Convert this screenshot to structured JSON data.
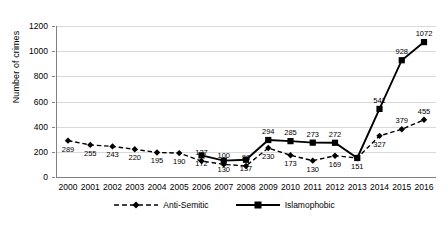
{
  "chart_data": {
    "type": "line",
    "title": "",
    "xlabel": "",
    "ylabel": "Number of crimes",
    "ylim": [
      0,
      1200
    ],
    "yticks": [
      0,
      200,
      400,
      600,
      800,
      1000,
      1200
    ],
    "grid": true,
    "legend_position": "bottom-center",
    "categories": [
      "2000",
      "2001",
      "2002",
      "2003",
      "2004",
      "2005",
      "2006",
      "2007",
      "2008",
      "2009",
      "2010",
      "2011",
      "2012",
      "2013",
      "2014",
      "2015",
      "2016"
    ],
    "series": [
      {
        "name": "Anti-Semitic",
        "style": "dashed",
        "marker": "diamond",
        "color": "#000000",
        "values": [
          289,
          255,
          243,
          220,
          195,
          190,
          127,
          100,
          88,
          230,
          173,
          130,
          169,
          151,
          327,
          379,
          455
        ],
        "labels": [
          "289",
          "255",
          "243",
          "220",
          "195",
          "190",
          "127",
          "100",
          "88",
          "230",
          "173",
          "130",
          "169",
          "151",
          "327",
          "379",
          "455"
        ]
      },
      {
        "name": "Islamophobic",
        "style": "solid",
        "marker": "square",
        "color": "#000000",
        "values": [
          null,
          null,
          null,
          null,
          null,
          null,
          172,
          130,
          137,
          294,
          285,
          273,
          272,
          151,
          541,
          928,
          1072
        ],
        "labels": [
          "",
          "",
          "",
          "",
          "",
          "",
          "172",
          "130",
          "137",
          "294",
          "285",
          "273",
          "272",
          "",
          "541",
          "928",
          "1072"
        ]
      }
    ]
  },
  "legend": {
    "items": [
      {
        "label": "Anti-Semitic"
      },
      {
        "label": "Islamophobic"
      }
    ]
  }
}
